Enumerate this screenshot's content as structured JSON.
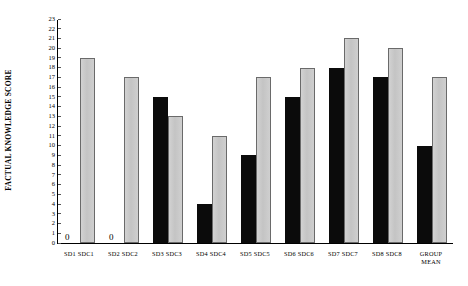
{
  "chart_data": {
    "type": "bar",
    "title": "",
    "xlabel": "",
    "ylabel": "FACTUAL KNOWLEDGE SCORE",
    "ylim": [
      0,
      23
    ],
    "ytick_labels": [
      "0",
      "1",
      "2",
      "3",
      "4",
      "5",
      "6",
      "7",
      "8",
      "9",
      "10",
      "11",
      "12",
      "13",
      "14",
      "15",
      "16",
      "17",
      "18",
      "19",
      "20",
      "21",
      "22",
      "23"
    ],
    "grid": false,
    "legend": "none",
    "categories": [
      "SD1 SDC1",
      "SD2 SDC2",
      "SD3 SDC3",
      "SD4 SDC4",
      "SD5 SDC5",
      "SD6 SDC6",
      "SD7 SDC7",
      "SD8 SDC8",
      "GROUP\nMEAN"
    ],
    "series": [
      {
        "name": "SD",
        "color": "#0b0b0b",
        "values": [
          0,
          0,
          15,
          4,
          9,
          15,
          18,
          17,
          10
        ]
      },
      {
        "name": "SDC",
        "color": "#c8c8c8",
        "values": [
          19,
          17,
          13,
          11,
          17,
          18,
          21,
          20,
          17
        ]
      }
    ],
    "annotations": [
      {
        "text": "0",
        "category_index": 0,
        "series": "SD"
      },
      {
        "text": "0",
        "category_index": 1,
        "series": "SD"
      }
    ]
  }
}
